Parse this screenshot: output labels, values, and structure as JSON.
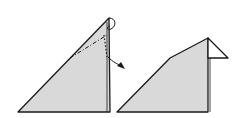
{
  "diagram": {
    "colors": {
      "paper": "#d9d9d9",
      "stroke": "#1a1a1a",
      "background": "#ffffff"
    },
    "steps": [
      {
        "label": "step-before-fold",
        "description": "Triangle with fold lines and arrow"
      },
      {
        "label": "step-after-fold",
        "description": "Folded tip forming a beak"
      }
    ]
  }
}
